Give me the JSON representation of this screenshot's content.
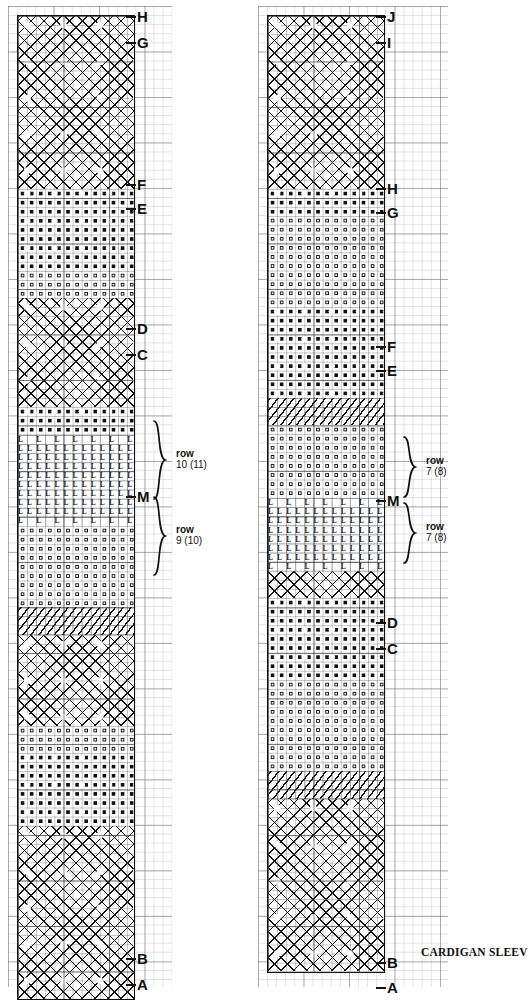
{
  "caption": "CARDIGAN SLEEV",
  "charts": [
    {
      "id": "left-chart",
      "name": "left-sleeve-chart",
      "markers": [
        {
          "label": "H",
          "y": 4
        },
        {
          "label": "G",
          "y": 30
        },
        {
          "label": "F",
          "y": 172
        },
        {
          "label": "E",
          "y": 196
        },
        {
          "label": "D",
          "y": 316
        },
        {
          "label": "C",
          "y": 342
        },
        {
          "label": "M",
          "y": 484
        },
        {
          "label": "B",
          "y": 946
        },
        {
          "label": "A",
          "y": 972
        }
      ],
      "brackets": [
        {
          "label_row": "row",
          "label_count": "10 (11)",
          "top": 414,
          "height": 80
        },
        {
          "label_row": "row",
          "label_count": "9 (10)",
          "top": 490,
          "height": 80
        }
      ],
      "bands": [
        {
          "kind": "cross",
          "rows": 19,
          "name": "band-cable-diamond"
        },
        {
          "kind": "dots",
          "rows": 9,
          "name": "band-bobble"
        },
        {
          "kind": "rings",
          "rows": 3,
          "name": "band-eyelet"
        },
        {
          "kind": "cross",
          "rows": 12,
          "name": "band-cable-diamond"
        },
        {
          "kind": "dots",
          "rows": 3,
          "name": "band-bobble"
        },
        {
          "kind": "ells",
          "rows": 10,
          "name": "band-twist-L"
        },
        {
          "kind": "rings",
          "rows": 9,
          "name": "band-eyelet"
        },
        {
          "kind": "slash",
          "rows": 3,
          "name": "band-slip-slash"
        },
        {
          "kind": "cross",
          "rows": 10,
          "name": "band-cable-diamond"
        },
        {
          "kind": "rings",
          "rows": 3,
          "name": "band-eyelet"
        },
        {
          "kind": "dots",
          "rows": 8,
          "name": "band-bobble"
        },
        {
          "kind": "cross",
          "rows": 19,
          "name": "band-cable-diamond"
        }
      ]
    },
    {
      "id": "right-chart",
      "name": "right-sleeve-chart",
      "markers": [
        {
          "label": "J",
          "y": 4
        },
        {
          "label": "I",
          "y": 30
        },
        {
          "label": "H",
          "y": 176
        },
        {
          "label": "G",
          "y": 200
        },
        {
          "label": "F",
          "y": 334
        },
        {
          "label": "E",
          "y": 358
        },
        {
          "label": "M",
          "y": 488
        },
        {
          "label": "D",
          "y": 610
        },
        {
          "label": "C",
          "y": 636
        },
        {
          "label": "B",
          "y": 950
        },
        {
          "label": "A",
          "y": 975
        }
      ],
      "brackets": [
        {
          "label_row": "row",
          "label_count": "7  (8)",
          "top": 430,
          "height": 62
        },
        {
          "label_row": "row",
          "label_count": "7  (8)",
          "top": 496,
          "height": 62
        }
      ],
      "bands": [
        {
          "kind": "cross",
          "rows": 19,
          "name": "band-cable-diamond"
        },
        {
          "kind": "dots",
          "rows": 3,
          "name": "band-bobble"
        },
        {
          "kind": "rings",
          "rows": 10,
          "name": "band-eyelet"
        },
        {
          "kind": "dots",
          "rows": 10,
          "name": "band-bobble"
        },
        {
          "kind": "slash",
          "rows": 3,
          "name": "band-slip-slash"
        },
        {
          "kind": "rings",
          "rows": 8,
          "name": "band-eyelet"
        },
        {
          "kind": "ells",
          "rows": 8,
          "name": "band-twist-L"
        },
        {
          "kind": "cross-thin",
          "rows": 3,
          "name": "band-cable-thin"
        },
        {
          "kind": "dots",
          "rows": 9,
          "name": "band-bobble"
        },
        {
          "kind": "rings",
          "rows": 10,
          "name": "band-eyelet"
        },
        {
          "kind": "slash",
          "rows": 3,
          "name": "band-slip-slash"
        },
        {
          "kind": "cross",
          "rows": 19,
          "name": "band-cable-diamond"
        }
      ]
    }
  ],
  "chart_data": {
    "type": "table",
    "title": "CARDIGAN SLEEV",
    "xlabel": "stitches",
    "ylabel": "rows",
    "grid": true,
    "legend": "none",
    "symbols": [
      {
        "key": "X",
        "meaning": "cross / cable diamond mesh"
      },
      {
        "key": "●",
        "meaning": "filled dot (bobble / colour stitch)"
      },
      {
        "key": "○",
        "meaning": "open ring (eyelet)"
      },
      {
        "key": "/",
        "meaning": "diagonal slash (slip stitch)"
      },
      {
        "key": "L",
        "meaning": "L-glyph (twisted stitch)"
      },
      {
        "key": "C",
        "meaning": "C-glyph (crossed stitch)"
      }
    ],
    "panels": [
      {
        "name": "left-sleeve-chart",
        "marker_labels": [
          "A",
          "B",
          "C",
          "D",
          "E",
          "F",
          "G",
          "H",
          "M"
        ],
        "row_callouts": [
          "row 10 (11)",
          "row 9 (10)"
        ],
        "band_sequence": [
          "cross",
          "dots",
          "rings",
          "cross",
          "dots",
          "ells",
          "rings",
          "slash",
          "cross",
          "rings",
          "dots",
          "cross"
        ],
        "band_row_counts": [
          19,
          9,
          3,
          12,
          3,
          10,
          9,
          3,
          10,
          3,
          8,
          19
        ],
        "stitch_columns": 13
      },
      {
        "name": "right-sleeve-chart",
        "marker_labels": [
          "A",
          "B",
          "C",
          "D",
          "E",
          "F",
          "G",
          "H",
          "I",
          "J",
          "M"
        ],
        "row_callouts": [
          "row 7 (8)",
          "row 7 (8)"
        ],
        "band_sequence": [
          "cross",
          "dots",
          "rings",
          "dots",
          "slash",
          "rings",
          "ells",
          "cross-thin",
          "dots",
          "rings",
          "slash",
          "cross"
        ],
        "band_row_counts": [
          19,
          3,
          10,
          10,
          3,
          8,
          8,
          3,
          9,
          10,
          3,
          19
        ],
        "stitch_columns": 13
      }
    ]
  }
}
